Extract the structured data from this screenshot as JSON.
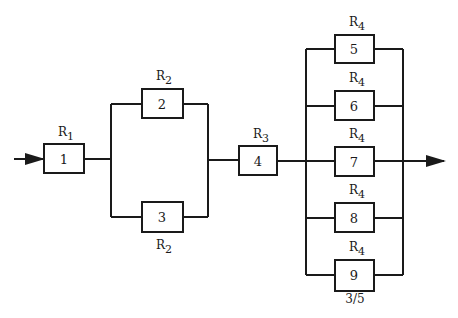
{
  "diagram": {
    "type": "reliability-block-diagram",
    "blocks": [
      {
        "id": "1",
        "label": "1",
        "reliability_base": "R",
        "reliability_sub": "1"
      },
      {
        "id": "2",
        "label": "2",
        "reliability_base": "R",
        "reliability_sub": "2"
      },
      {
        "id": "3",
        "label": "3",
        "reliability_base": "R",
        "reliability_sub": "2"
      },
      {
        "id": "4",
        "label": "4",
        "reliability_base": "R",
        "reliability_sub": "3"
      },
      {
        "id": "5",
        "label": "5",
        "reliability_base": "R",
        "reliability_sub": "4"
      },
      {
        "id": "6",
        "label": "6",
        "reliability_base": "R",
        "reliability_sub": "4"
      },
      {
        "id": "7",
        "label": "7",
        "reliability_base": "R",
        "reliability_sub": "4"
      },
      {
        "id": "8",
        "label": "8",
        "reliability_base": "R",
        "reliability_sub": "4"
      },
      {
        "id": "9",
        "label": "9",
        "reliability_base": "R",
        "reliability_sub": "4"
      }
    ],
    "groups": [
      {
        "name": "series-input",
        "blocks": [
          "1"
        ]
      },
      {
        "name": "parallel-pair",
        "blocks": [
          "2",
          "3"
        ]
      },
      {
        "name": "series-middle",
        "blocks": [
          "4"
        ]
      },
      {
        "name": "k-out-of-n",
        "blocks": [
          "5",
          "6",
          "7",
          "8",
          "9"
        ],
        "annotation": "3/5"
      }
    ],
    "connections": [
      [
        "input",
        "1"
      ],
      [
        "1",
        "2"
      ],
      [
        "1",
        "3"
      ],
      [
        "2",
        "4"
      ],
      [
        "3",
        "4"
      ],
      [
        "4",
        "5"
      ],
      [
        "4",
        "6"
      ],
      [
        "4",
        "7"
      ],
      [
        "4",
        "8"
      ],
      [
        "4",
        "9"
      ],
      [
        "5",
        "output"
      ],
      [
        "6",
        "output"
      ],
      [
        "7",
        "output"
      ],
      [
        "8",
        "output"
      ],
      [
        "9",
        "output"
      ]
    ],
    "vote_label": "3/5"
  }
}
